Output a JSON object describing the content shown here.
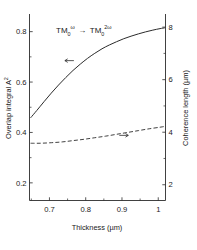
{
  "chart_data": {
    "type": "line",
    "title": "",
    "xlabel": "Thickness  (µm)",
    "ylabel": "Overlap integral  A²",
    "y2label": "Coherence length  (µm)",
    "xlim": [
      0.645,
      1.02
    ],
    "ylim": [
      0.13,
      0.87
    ],
    "y2lim": [
      1.4,
      8.5
    ],
    "xticks": [
      "0.7",
      "0.8",
      "0.9",
      "1"
    ],
    "xtick_values": [
      0.7,
      0.8,
      0.9,
      1.0
    ],
    "yticks": [
      "0.2",
      "0.4",
      "0.6",
      "0.8"
    ],
    "ytick_values": [
      0.2,
      0.4,
      0.6,
      0.8
    ],
    "y2ticks": [
      "2",
      "4",
      "6",
      "8"
    ],
    "y2tick_values": [
      2,
      4,
      6,
      8
    ],
    "grid": false,
    "legend": "none",
    "annotation": {
      "text_parts": [
        "TM",
        "0",
        "ω",
        "→",
        "TM",
        "0",
        "2ω"
      ],
      "full_text": "TM₀^ω → TM₀^2ω",
      "mode_in": "TM",
      "mode_in_sub": "0",
      "mode_in_sup": "ω",
      "arrow": "→",
      "mode_out": "TM",
      "mode_out_sub": "0",
      "mode_out_sup": "2ω"
    },
    "series": [
      {
        "name": "Overlap integral A²",
        "axis": "left",
        "style": "solid",
        "arrow_marker": "left",
        "arrow_marker_x": 0.755,
        "arrow_marker_y": 0.685,
        "x": [
          0.648,
          0.665,
          0.685,
          0.705,
          0.725,
          0.745,
          0.765,
          0.785,
          0.805,
          0.825,
          0.845,
          0.865,
          0.885,
          0.905,
          0.925,
          0.945,
          0.965,
          0.985,
          1.005,
          1.018
        ],
        "y": [
          0.458,
          0.487,
          0.522,
          0.556,
          0.588,
          0.618,
          0.646,
          0.671,
          0.694,
          0.714,
          0.732,
          0.747,
          0.76,
          0.772,
          0.782,
          0.791,
          0.799,
          0.806,
          0.812,
          0.815
        ]
      },
      {
        "name": "Coherence length (µm)",
        "axis": "right",
        "style": "dashed",
        "arrow_marker": "right",
        "arrow_marker_x": 0.905,
        "arrow_marker_y": 3.88,
        "x": [
          0.648,
          0.675,
          0.705,
          0.735,
          0.765,
          0.795,
          0.825,
          0.855,
          0.885,
          0.915,
          0.945,
          0.975,
          1.005,
          1.018
        ],
        "y": [
          3.58,
          3.58,
          3.6,
          3.63,
          3.68,
          3.73,
          3.79,
          3.85,
          3.92,
          3.99,
          4.06,
          4.13,
          4.19,
          4.22
        ]
      }
    ]
  },
  "axis_titles": {
    "left": "Overlap integral  A",
    "left_sup": "2",
    "right": "Coherence length  (µm)",
    "bottom": "Thickness  (µm)"
  }
}
